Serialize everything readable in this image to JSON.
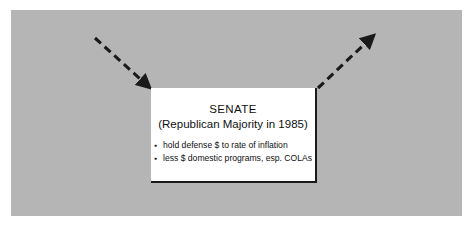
{
  "figure": {
    "panel_color": "#b5b5b5",
    "background_color": "#ffffff",
    "ink_color": "#1a1a1a"
  },
  "callout": {
    "title": "SENATE",
    "subtitle": "(Republican Majority in 1985)",
    "bullets": [
      "hold defense $ to rate of inflation",
      "less $ domestic programs, esp. COLAs"
    ]
  },
  "arrows": [
    {
      "name": "incoming-arrow",
      "direction": "down-right",
      "style": "dashed",
      "color": "#1a1a1a"
    },
    {
      "name": "outgoing-arrow",
      "direction": "up-right",
      "style": "dashed",
      "color": "#1a1a1a"
    }
  ]
}
